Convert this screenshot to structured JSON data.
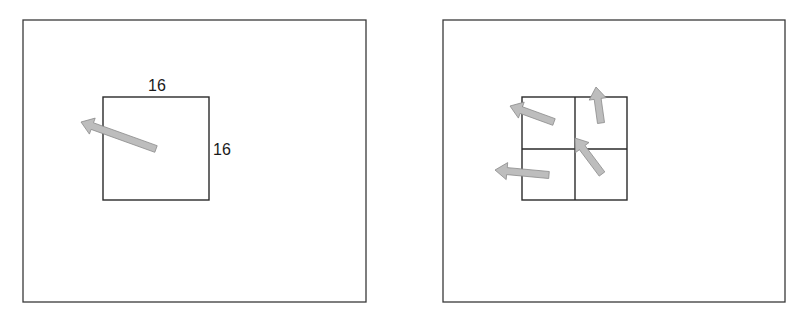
{
  "figure": {
    "panels": [
      {
        "id": "left",
        "frame": {
          "x": 23,
          "y": 20,
          "w": 343,
          "h": 282
        },
        "block": {
          "x": 103,
          "y": 97,
          "w": 106,
          "h": 103
        },
        "labels": {
          "width_label": "16",
          "height_label": "16"
        },
        "arrows": [
          {
            "tail": [
              156,
              149
            ],
            "tip": [
              81,
              122
            ]
          }
        ]
      },
      {
        "id": "right",
        "frame": {
          "x": 443,
          "y": 20,
          "w": 342,
          "h": 282
        },
        "grid": {
          "x": 522,
          "y": 97,
          "w": 105,
          "h": 103,
          "rows": 2,
          "cols": 2
        },
        "arrows": [
          {
            "cell": "top-left",
            "tail": [
              554,
              122
            ],
            "tip": [
              510,
              106
            ]
          },
          {
            "cell": "top-right",
            "tail": [
              601,
              123
            ],
            "tip": [
              596,
              87
            ]
          },
          {
            "cell": "bottom-right",
            "tail": [
              602,
              174
            ],
            "tip": [
              575,
              138
            ]
          },
          {
            "cell": "bottom-left",
            "tail": [
              549,
              175
            ],
            "tip": [
              495,
              170
            ]
          }
        ]
      }
    ],
    "colors": {
      "line": "#2a2a2a",
      "arrow_fill": "#bdbdbd",
      "arrow_stroke": "#8a8a8a"
    }
  }
}
